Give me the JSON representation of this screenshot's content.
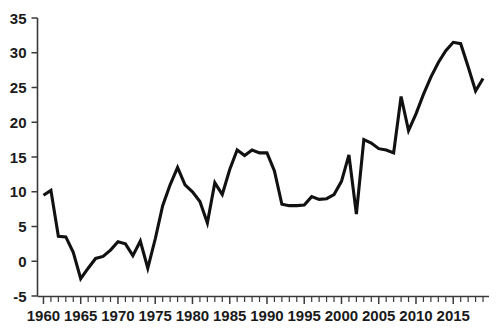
{
  "chart_data": {
    "type": "line",
    "title": "",
    "subtitle": "",
    "xlabel": "",
    "ylabel": "",
    "xlim": [
      1959.2,
      2019.8
    ],
    "ylim": [
      -5,
      35
    ],
    "grid": false,
    "legend": null,
    "y_ticks": [
      -5,
      0,
      5,
      10,
      15,
      20,
      25,
      30,
      35
    ],
    "y_tick_labels": [
      "-5",
      "0",
      "5",
      "10",
      "15",
      "20",
      "25",
      "30",
      "35"
    ],
    "x_ticks_major": [
      1960,
      1965,
      1970,
      1975,
      1980,
      1985,
      1990,
      1995,
      2000,
      2005,
      2010,
      2015
    ],
    "x_tick_labels": [
      "1960",
      "1965",
      "1970",
      "1975",
      "1980",
      "1985",
      "1990",
      "1995",
      "2000",
      "2005",
      "2010",
      "2015"
    ],
    "x_minor_tick_step": 1,
    "x": [
      1960,
      1961,
      1962,
      1963,
      1964,
      1965,
      1966,
      1967,
      1968,
      1969,
      1970,
      1971,
      1972,
      1973,
      1974,
      1975,
      1976,
      1977,
      1978,
      1979,
      1980,
      1981,
      1982,
      1983,
      1984,
      1985,
      1986,
      1987,
      1988,
      1989,
      1990,
      1991,
      1992,
      1993,
      1994,
      1995,
      1996,
      1997,
      1998,
      1999,
      2000,
      2001,
      2002,
      2003,
      2004,
      2005,
      2006,
      2007,
      2008,
      2009,
      2010,
      2011,
      2012,
      2013,
      2014,
      2015,
      2016,
      2017,
      2018,
      2019
    ],
    "values": [
      9.5,
      10.2,
      3.6,
      3.5,
      1.3,
      -2.5,
      -1.0,
      0.4,
      0.7,
      1.6,
      2.8,
      2.5,
      0.8,
      2.9,
      -1.0,
      3.2,
      8.0,
      11.0,
      13.5,
      11.0,
      10.0,
      8.6,
      5.5,
      11.3,
      9.6,
      13.2,
      16.0,
      15.2,
      16.0,
      15.6,
      15.6,
      13.0,
      8.2,
      8.0,
      8.0,
      8.1,
      9.3,
      8.9,
      9.0,
      9.6,
      11.5,
      15.3,
      6.8,
      17.5,
      17.0,
      16.2,
      16.0,
      15.6,
      23.7,
      18.8,
      21.2,
      24.0,
      26.5,
      28.6,
      30.3,
      31.5,
      31.3,
      28.0,
      24.5,
      26.3
    ],
    "series_color": "#111111",
    "series_name": ""
  },
  "figure": {
    "background_color": "#ffffff",
    "axis_color": "#3a3a3a",
    "label_color": "#1a1a1a"
  }
}
